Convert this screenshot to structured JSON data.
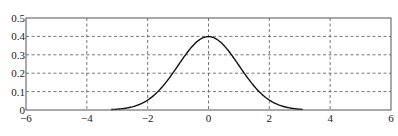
{
  "chart_data": {
    "type": "line",
    "title": "",
    "xlabel": "",
    "ylabel": "",
    "xlim": [
      -6,
      6
    ],
    "ylim": [
      0,
      0.5
    ],
    "xticks": [
      -6,
      -4,
      -2,
      0,
      2,
      4,
      6
    ],
    "yticks": [
      0,
      0.1,
      0.2,
      0.3,
      0.4,
      0.5
    ],
    "xtick_labels": [
      "−6",
      "−4",
      "−2",
      "0",
      "2",
      "4",
      "6"
    ],
    "ytick_labels": [
      "0",
      "0.1",
      "0.2",
      "0.3",
      "0.4",
      "0.5"
    ],
    "grid": true,
    "grid_style": "dashed",
    "legend": null,
    "series": [
      {
        "name": "standard normal pdf",
        "x": [
          -3.2,
          -3.0,
          -2.5,
          -2.0,
          -1.5,
          -1.0,
          -0.5,
          0.0,
          0.5,
          1.0,
          1.5,
          2.0,
          2.5,
          3.0,
          3.1
        ],
        "y": [
          0.0024,
          0.0044,
          0.0175,
          0.054,
          0.1295,
          0.242,
          0.3521,
          0.3989,
          0.3521,
          0.242,
          0.1295,
          0.054,
          0.0175,
          0.0044,
          0.0033
        ],
        "color": "#111111"
      }
    ]
  }
}
